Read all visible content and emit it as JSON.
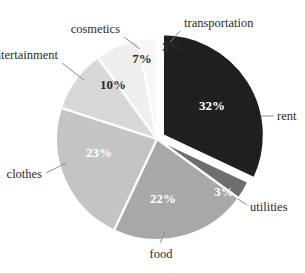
{
  "chart_data": {
    "type": "pie",
    "title": "",
    "legend_position": "outside-labels",
    "total": 100,
    "unit": "%",
    "categories": [
      "rent",
      "utilities",
      "food",
      "clothes",
      "entertainment",
      "cosmetics",
      "transportation"
    ],
    "values": [
      32,
      3,
      22,
      23,
      10,
      7,
      3
    ],
    "labels": [
      "32%",
      "3%",
      "22%",
      "23%",
      "10%",
      "7%",
      "3%"
    ],
    "colors": [
      "#1f1f1f",
      "#6e6e6e",
      "#a8a8a8",
      "#c4c4c4",
      "#d8d8d8",
      "#efefef",
      "#f7f7f7"
    ],
    "slices": [
      {
        "name": "rent",
        "value": 32,
        "label": "32%",
        "color": "#1f1f1f",
        "exploded": true,
        "label_color": "light"
      },
      {
        "name": "utilities",
        "value": 3,
        "label": "3%",
        "color": "#6e6e6e",
        "exploded": false,
        "label_color": "light"
      },
      {
        "name": "food",
        "value": 22,
        "label": "22%",
        "color": "#a8a8a8",
        "exploded": false,
        "label_color": "light"
      },
      {
        "name": "clothes",
        "value": 23,
        "label": "23%",
        "color": "#c4c4c4",
        "exploded": false,
        "label_color": "light"
      },
      {
        "name": "entertainment",
        "value": 10,
        "label": "10%",
        "color": "#d8d8d8",
        "exploded": false,
        "label_color": "dark"
      },
      {
        "name": "cosmetics",
        "value": 7,
        "label": "7%",
        "color": "#efefef",
        "exploded": false,
        "label_color": "dark"
      },
      {
        "name": "transportation",
        "value": 3,
        "label": "3%",
        "color": "#f7f7f7",
        "exploded": false,
        "label_color": "dark"
      }
    ],
    "category_labels": {
      "rent": "rent",
      "utilities": "utilities",
      "food": "food",
      "clothes": "clothes",
      "entertainment": "entertainment",
      "cosmetics": "cosmetics",
      "transportation": "transportation"
    },
    "background_color": "#ffffff",
    "separator_color": "#ffffff"
  }
}
